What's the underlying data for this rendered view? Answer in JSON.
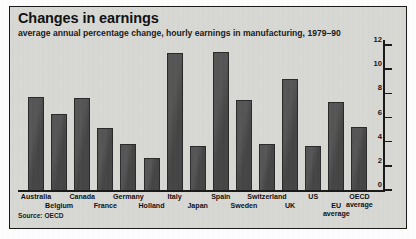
{
  "header": {
    "title": "Changes in earnings",
    "subtitle": "average annual percentage change, hourly earnings in manufacturing, 1979–90"
  },
  "source": "Source: OECD",
  "style": {
    "bar_color": "#4a4a4a",
    "bar_edge_color": "#2b2b2b",
    "panel_color": "#d9d9d6",
    "axis_color": "#1a1a1a",
    "text_color": "#111111"
  },
  "chart_data": {
    "type": "bar",
    "title": "Changes in earnings",
    "subtitle": "average annual percentage change, hourly earnings in manufacturing, 1979–90",
    "xlabel": "",
    "ylabel": "",
    "ylim": [
      0,
      12
    ],
    "yticks": [
      0,
      2,
      4,
      6,
      8,
      10,
      12
    ],
    "ytick_labels": [
      "0",
      "2",
      "4",
      "6",
      "8",
      "10",
      "12"
    ],
    "y_axis_position": "right",
    "grid": false,
    "legend": null,
    "source": "Source: OECD",
    "categories": [
      "Australia",
      "Belgium",
      "Canada",
      "France",
      "Germany",
      "Holland",
      "Italy",
      "Japan",
      "Spain",
      "Sweden",
      "Switzerland",
      "UK",
      "US",
      "EU average",
      "OECD average"
    ],
    "category_label_rows": [
      0,
      1,
      0,
      1,
      0,
      1,
      0,
      1,
      0,
      1,
      0,
      1,
      0,
      1,
      0
    ],
    "values": [
      7.8,
      6.4,
      7.7,
      5.2,
      3.9,
      2.7,
      11.4,
      3.7,
      11.5,
      7.5,
      3.9,
      9.3,
      3.7,
      7.4,
      5.3
    ]
  }
}
